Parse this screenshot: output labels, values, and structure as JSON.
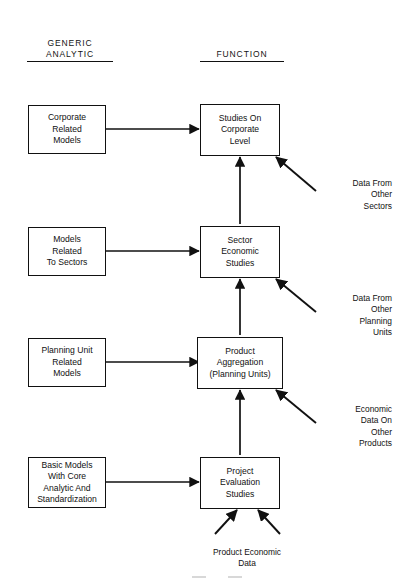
{
  "headers": {
    "generic_analytic": "GENERIC\nANALYTIC",
    "function": "FUNCTION"
  },
  "generic_analytic_nodes": [
    {
      "id": "corporate-related-models",
      "label": "Corporate\nRelated\nModels"
    },
    {
      "id": "models-related-to-sectors",
      "label": "Models\nRelated\nTo Sectors"
    },
    {
      "id": "planning-unit-related-models",
      "label": "Planning Unit\nRelated\nModels"
    },
    {
      "id": "basic-models-core-analytic",
      "label": "Basic Models\nWith Core\nAnalytic And\nStandardization"
    }
  ],
  "function_nodes": [
    {
      "id": "studies-on-corporate-level",
      "label": "Studies On\nCorporate\nLevel"
    },
    {
      "id": "sector-economic-studies",
      "label": "Sector\nEconomic\nStudies"
    },
    {
      "id": "product-aggregation",
      "label": "Product\nAggregation\n(Planning Units)"
    },
    {
      "id": "project-evaluation-studies",
      "label": "Project\nEvaluation\nStudies"
    }
  ],
  "external_inputs": [
    {
      "id": "data-from-other-sectors",
      "label": "Data From\nOther\nSectors"
    },
    {
      "id": "data-from-other-planning-units",
      "label": "Data From\nOther\nPlanning\nUnits"
    },
    {
      "id": "economic-data-on-other-products",
      "label": "Economic\nData On\nOther\nProducts"
    },
    {
      "id": "product-economic-data",
      "label": "Product Economic\nData"
    }
  ],
  "style": {
    "line_color": "#111111",
    "background": "#ffffff"
  }
}
